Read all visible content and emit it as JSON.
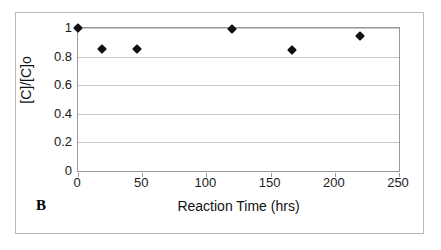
{
  "figure": {
    "panel_label": "B",
    "background_color": "#ffffff",
    "frame_color": "#b9b9b9",
    "plot_border_color": "#9a9a9a",
    "gridline_color": "#c8c8c8",
    "marker_color": "#101010"
  },
  "chart_data": {
    "type": "scatter",
    "title": "",
    "xlabel": "Reaction Time (hrs)",
    "ylabel": "[C]/[C]o",
    "xlim": [
      0,
      250
    ],
    "ylim": [
      0,
      1
    ],
    "xticks": [
      0,
      50,
      100,
      150,
      200,
      250
    ],
    "xtick_labels": [
      "0",
      "50",
      "100",
      "150",
      "200",
      "250"
    ],
    "yticks": [
      0,
      0.2,
      0.4,
      0.6,
      0.8,
      1
    ],
    "ytick_labels": [
      "0",
      "0.2",
      "0.4",
      "0.6",
      "0.8",
      "1"
    ],
    "grid": "horizontal",
    "legend": "none",
    "marker": "diamond",
    "series": [
      {
        "name": "[C]/[C]o",
        "x": [
          0,
          19,
          46,
          120,
          167,
          220
        ],
        "y": [
          1.0,
          0.855,
          0.85,
          0.995,
          0.845,
          0.945
        ]
      }
    ]
  }
}
